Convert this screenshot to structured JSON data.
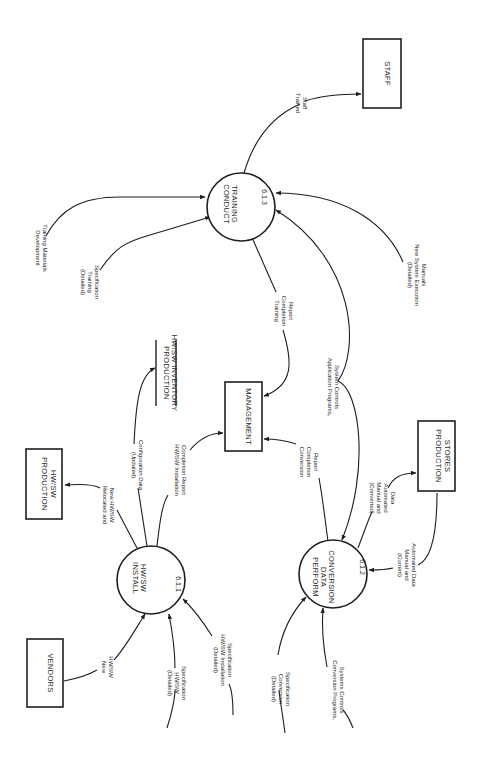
{
  "diagram": {
    "type": "data-flow-diagram",
    "orientation": "rotated-90-clockwise",
    "processes": [
      {
        "id": "p611",
        "label_lines": [
          "INSTALL",
          "HW/SW"
        ],
        "number": "6.1.1"
      },
      {
        "id": "p612",
        "label_lines": [
          "PERFORM",
          "DATA",
          "CONVERSION"
        ],
        "number": "6.1.2"
      },
      {
        "id": "p613",
        "label_lines": [
          "CONDUCT",
          "TRAINING"
        ],
        "number": "6.1.3"
      }
    ],
    "externals": [
      {
        "id": "vendors",
        "label_lines": [
          "VENDORS"
        ]
      },
      {
        "id": "prod_hwsw",
        "label_lines": [
          "PRODUCTION",
          "HW/SW"
        ]
      },
      {
        "id": "management",
        "label_lines": [
          "MANAGEMENT"
        ]
      },
      {
        "id": "prod_stores",
        "label_lines": [
          "PRODUCTION",
          "STORES"
        ]
      },
      {
        "id": "staff",
        "label_lines": [
          "STAFF"
        ]
      }
    ],
    "data_stores": [
      {
        "id": "inventory",
        "label_lines": [
          "PRODUCTION",
          "HW/SW INVENTORY"
        ]
      }
    ],
    "flows": [
      {
        "id": "f1",
        "label_lines": [
          "Development",
          "Training Materials"
        ],
        "to": "p613"
      },
      {
        "id": "f2",
        "label_lines": [
          "(Detailed)",
          "Training",
          "Specification"
        ],
        "to": "p613"
      },
      {
        "id": "f3",
        "label_lines": [
          "Trained",
          "Staff"
        ],
        "from": "p613",
        "to": "staff"
      },
      {
        "id": "f4",
        "label_lines": [
          "Training",
          "Completion",
          "Report"
        ],
        "from": "p613",
        "to": "management"
      },
      {
        "id": "f5",
        "label_lines": [
          "(Detailed)",
          "New System Execution",
          "Manuals"
        ],
        "to": "p613"
      },
      {
        "id": "f6",
        "label_lines": [
          "Application Programs,",
          "System Controls"
        ],
        "to": [
          "p613",
          "p612"
        ]
      },
      {
        "id": "f7",
        "label_lines": [
          "(Updated)",
          "Configuration Data"
        ],
        "from": "p611",
        "to": "inventory"
      },
      {
        "id": "f8",
        "label_lines": [
          "HW/SW Installation",
          "Completion Report"
        ],
        "from": "p611",
        "to": "management"
      },
      {
        "id": "f9",
        "label_lines": [
          "Relocated and",
          "New HW/SW"
        ],
        "from": "p611",
        "to": "prod_hwsw"
      },
      {
        "id": "f10",
        "label_lines": [
          "New",
          "HW/SW"
        ],
        "from": "vendors",
        "to": "p611"
      },
      {
        "id": "f11",
        "label_lines": [
          "(Detailed)",
          "HW/SW",
          "Specification"
        ],
        "to": "p611"
      },
      {
        "id": "f12",
        "label_lines": [
          "(Detailed)",
          "HW/SW Installation",
          "Specification"
        ],
        "to": "p611"
      },
      {
        "id": "f13",
        "label_lines": [
          "Conversion",
          "Completion",
          "Report"
        ],
        "from": "p612",
        "to": "management"
      },
      {
        "id": "f14",
        "label_lines": [
          "(Converted)",
          "Manual and",
          "Automated",
          "Data"
        ],
        "from": "p612",
        "to": "prod_stores"
      },
      {
        "id": "f15",
        "label_lines": [
          "(Current)",
          "Manual and",
          "Automated Data"
        ],
        "from": "prod_stores",
        "to": "p612"
      },
      {
        "id": "f16",
        "label_lines": [
          "(Detailed)",
          "Conversion",
          "Specification"
        ],
        "to": "p612"
      },
      {
        "id": "f17",
        "label_lines": [
          "Conversion  Programs,",
          "Systems Controls"
        ],
        "to": "p612"
      }
    ]
  }
}
